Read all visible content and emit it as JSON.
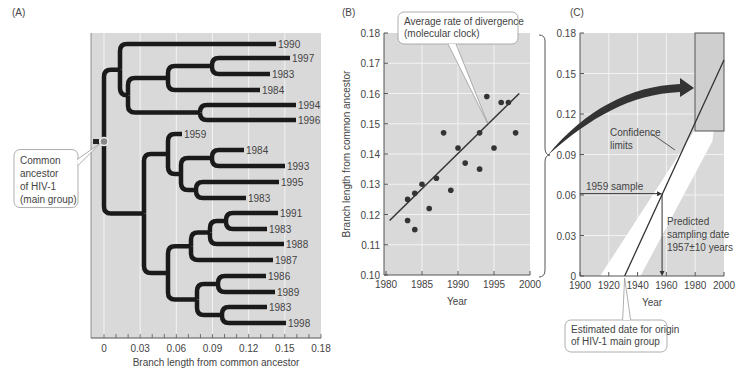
{
  "chart_data": [
    {
      "panel": "(A)",
      "type": "tree",
      "xlabel": "Branch length from common ancestor",
      "xticks": [
        "0",
        "0.03",
        "0.06",
        "0.09",
        "0.12",
        "0.15",
        "0.18"
      ],
      "xlim": [
        0,
        0.18
      ],
      "leaves": [
        "1990",
        "1997",
        "1983",
        "1984",
        "1994",
        "1996",
        "1959",
        "1984",
        "1993",
        "1995",
        "1983",
        "1991",
        "1983",
        "1988",
        "1987",
        "1986",
        "1989",
        "1983",
        "1998"
      ],
      "annotation": [
        "Common",
        "ancestor",
        "of HIV-1",
        "(main group)"
      ]
    },
    {
      "panel": "(B)",
      "type": "scatter",
      "xlabel": "Year",
      "ylabel": "Branch length from common ancestor",
      "xticks": [
        "1980",
        "1985",
        "1990",
        "1995",
        "2000"
      ],
      "yticks": [
        "0.10",
        "0.11",
        "0.12",
        "0.13",
        "0.14",
        "0.15",
        "0.16",
        "0.17",
        "0.18"
      ],
      "xlim": [
        1980,
        2000
      ],
      "ylim": [
        0.1,
        0.18
      ],
      "points": [
        {
          "x": 1983,
          "y": 0.125
        },
        {
          "x": 1983,
          "y": 0.118
        },
        {
          "x": 1984,
          "y": 0.127
        },
        {
          "x": 1984,
          "y": 0.115
        },
        {
          "x": 1985,
          "y": 0.13
        },
        {
          "x": 1986,
          "y": 0.122
        },
        {
          "x": 1987,
          "y": 0.132
        },
        {
          "x": 1988,
          "y": 0.147
        },
        {
          "x": 1989,
          "y": 0.128
        },
        {
          "x": 1990,
          "y": 0.142
        },
        {
          "x": 1991,
          "y": 0.137
        },
        {
          "x": 1993,
          "y": 0.147
        },
        {
          "x": 1993,
          "y": 0.135
        },
        {
          "x": 1994,
          "y": 0.159
        },
        {
          "x": 1995,
          "y": 0.142
        },
        {
          "x": 1996,
          "y": 0.157
        },
        {
          "x": 1997,
          "y": 0.157
        },
        {
          "x": 1998,
          "y": 0.147
        }
      ],
      "fit_line": {
        "x": [
          1980.5,
          1998.5
        ],
        "y": [
          0.118,
          0.16
        ]
      },
      "annotation": [
        "Average rate of divergence",
        "(molecular clock)"
      ]
    },
    {
      "panel": "(C)",
      "type": "line",
      "xlabel": "Year",
      "xticks": [
        "1900",
        "1920",
        "1940",
        "1960",
        "1980",
        "2000"
      ],
      "yticks": [
        "0",
        "0.03",
        "0.06",
        "0.09",
        "0.12",
        "0.15",
        "0.18"
      ],
      "xlim": [
        1900,
        2000
      ],
      "ylim": [
        0,
        0.18
      ],
      "regression_line": {
        "x": [
          1931,
          2000
        ],
        "y": [
          0,
          0.16
        ]
      },
      "sample_1959": {
        "y": 0.061,
        "predicted_year": 1957
      },
      "annotations": {
        "confidence": [
          "Confidence",
          "limits"
        ],
        "sample": "1959 sample",
        "predicted": [
          "Predicted",
          "sampling date",
          "1957±10 years"
        ],
        "origin": [
          "Estimated date for origin",
          "of HIV-1 main group"
        ]
      }
    }
  ],
  "labels": {
    "panel_a": "(A)",
    "panel_b": "(B)",
    "panel_c": "(C)"
  }
}
